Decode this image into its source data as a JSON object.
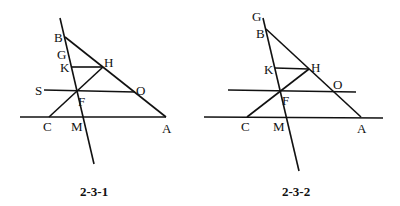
{
  "figures": [
    {
      "caption": "2-3-1",
      "labels": {
        "B": "B",
        "G": "G",
        "K": "K",
        "H": "H",
        "S": "S",
        "O": "O",
        "F": "F",
        "C": "C",
        "M": "M",
        "A": "A"
      }
    },
    {
      "caption": "2-3-2",
      "labels": {
        "G": "G",
        "B": "B",
        "K": "K",
        "H": "H",
        "O": "O",
        "F": "F",
        "C": "C",
        "M": "M",
        "A": "A"
      }
    }
  ]
}
